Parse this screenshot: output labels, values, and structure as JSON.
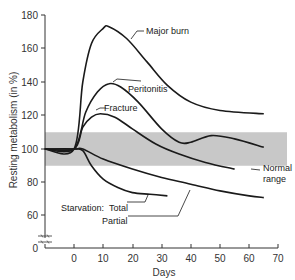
{
  "chart_data": {
    "type": "line",
    "title": "",
    "xlabel": "Days",
    "ylabel": "Resting metabolism (in %)",
    "xlim": [
      -10,
      70
    ],
    "ylim": [
      0,
      180
    ],
    "y_axis_break": "between 0 and 60",
    "grid": false,
    "x_ticks": [
      0,
      10,
      20,
      30,
      40,
      50,
      60,
      70
    ],
    "y_ticks": [
      0,
      60,
      80,
      100,
      120,
      140,
      160,
      180
    ],
    "normal_range": {
      "label": "Normal range",
      "low": 90,
      "high": 110,
      "color": "#c8c8c8"
    },
    "series": [
      {
        "name": "Major burn",
        "x": [
          -10,
          0,
          3,
          6,
          10,
          12,
          18,
          25,
          32,
          40,
          50,
          65
        ],
        "values": [
          100,
          100,
          140,
          163,
          172,
          173,
          166,
          152,
          138,
          128,
          123,
          121
        ]
      },
      {
        "name": "Peritonitis",
        "x": [
          -10,
          0,
          4,
          8,
          12,
          16,
          22,
          30,
          36,
          40,
          47,
          55,
          65
        ],
        "values": [
          100,
          100,
          122,
          134,
          139,
          137,
          128,
          112,
          104,
          104,
          108,
          106,
          101
        ]
      },
      {
        "name": "Fracture",
        "x": [
          -10,
          0,
          3,
          6,
          9,
          14,
          20,
          28,
          36,
          45,
          55
        ],
        "values": [
          100,
          100,
          113,
          119,
          121,
          119,
          112,
          103,
          97,
          92,
          88
        ]
      },
      {
        "name": "Starvation: Total",
        "x": [
          -10,
          0,
          3,
          6,
          10,
          15,
          20,
          26,
          32
        ],
        "values": [
          100,
          100,
          99,
          90,
          82,
          77,
          74,
          73,
          72
        ]
      },
      {
        "name": "Starvation: Partial",
        "x": [
          -10,
          0,
          3,
          10,
          20,
          30,
          40,
          50,
          60,
          65
        ],
        "values": [
          100,
          100,
          100,
          94,
          88,
          83,
          79,
          75,
          72,
          71
        ]
      }
    ],
    "annotations": {
      "major_burn": "Major burn",
      "peritonitis": "Peritonitis",
      "fracture": "Fracture",
      "starvation": "Starvation:",
      "total": "Total",
      "partial": "Partial",
      "normal_line1": "Normal",
      "normal_line2": "range"
    },
    "colors": {
      "line": "#1a1a1a",
      "band": "#c8c8c8",
      "axis": "#333333"
    }
  }
}
